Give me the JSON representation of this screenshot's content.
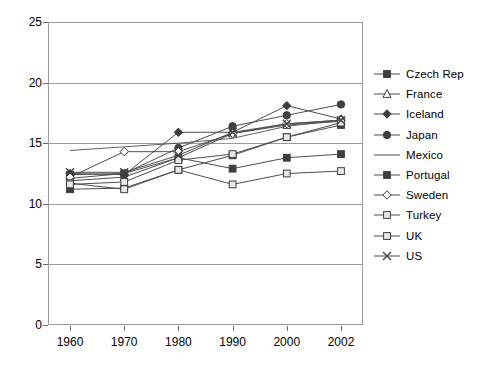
{
  "chart_data": {
    "type": "line",
    "title": "",
    "subtitle": "",
    "xlabel": "",
    "ylabel": "",
    "categories": [
      "1960",
      "1970",
      "1980",
      "1990",
      "2000",
      "2002"
    ],
    "ylim": [
      0,
      25
    ],
    "yticks": [
      0,
      5,
      10,
      15,
      20,
      25
    ],
    "ytick_labels": [
      "0",
      "5",
      "10",
      "15",
      "20",
      "25"
    ],
    "grid": true,
    "grid_axis": "y",
    "legend_position": "right",
    "series": [
      {
        "name": "Czech Rep",
        "marker": "filled-square",
        "values": [
          12.4,
          12.5,
          13.8,
          12.9,
          13.8,
          14.1
        ]
      },
      {
        "name": "France",
        "marker": "open-triangle",
        "values": [
          11.9,
          12.2,
          13.8,
          15.8,
          16.5,
          16.8
        ]
      },
      {
        "name": "Iceland",
        "marker": "filled-diamond",
        "values": [
          12.5,
          12.4,
          15.9,
          15.9,
          18.1,
          17.0
        ]
      },
      {
        "name": "Japan",
        "marker": "filled-circle",
        "values": [
          12.1,
          12.5,
          14.6,
          16.4,
          17.3,
          18.2
        ]
      },
      {
        "name": "Mexico",
        "marker": "none",
        "values": [
          14.4,
          14.7,
          15.0,
          15.4,
          16.4,
          16.9
        ]
      },
      {
        "name": "Portugal",
        "marker": "filled-square",
        "values": [
          11.2,
          11.3,
          12.8,
          14.0,
          15.5,
          16.5
        ]
      },
      {
        "name": "Sweden",
        "marker": "open-diamond",
        "values": [
          12.2,
          14.3,
          14.3,
          15.8,
          16.6,
          16.9
        ]
      },
      {
        "name": "Turkey",
        "marker": "open-square",
        "values": [
          11.7,
          11.2,
          12.8,
          11.6,
          12.5,
          12.7
        ]
      },
      {
        "name": "UK",
        "marker": "open-square",
        "values": [
          11.6,
          11.8,
          13.6,
          14.1,
          15.5,
          16.7
        ]
      },
      {
        "name": "US",
        "marker": "x-cross",
        "values": [
          12.6,
          12.6,
          14.0,
          15.9,
          16.6,
          16.9
        ]
      }
    ]
  },
  "legend": {
    "items": [
      {
        "label": "Czech Rep"
      },
      {
        "label": "France"
      },
      {
        "label": "Iceland"
      },
      {
        "label": "Japan"
      },
      {
        "label": "Mexico"
      },
      {
        "label": "Portugal"
      },
      {
        "label": "Sweden"
      },
      {
        "label": "Turkey"
      },
      {
        "label": "UK"
      },
      {
        "label": "US"
      }
    ]
  },
  "colors": {
    "line": "#4d4d4d",
    "marker_dark": "#3f3f3f",
    "marker_light": "#b8b8b8",
    "axis": "#9a9a9a",
    "text": "#000000"
  }
}
